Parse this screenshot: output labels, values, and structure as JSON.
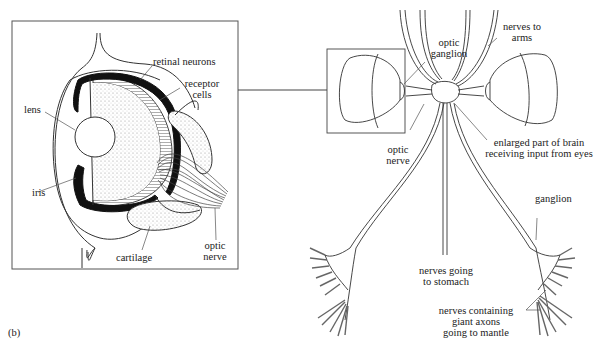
{
  "figure": {
    "panel_label": "(b)"
  },
  "eye_detail": {
    "labels": {
      "retinal_neurons": "retinal neurons",
      "receptor_cells_1": "receptor",
      "receptor_cells_2": "cells",
      "lens": "lens",
      "iris": "iris",
      "cartilage": "cartilage",
      "optic_nerve_1": "optic",
      "optic_nerve_2": "nerve"
    }
  },
  "nervous_system": {
    "labels": {
      "optic_ganglion_1": "optic",
      "optic_ganglion_2": "ganglion",
      "nerves_to_arms_1": "nerves to",
      "nerves_to_arms_2": "arms",
      "optic_nerve_1": "optic",
      "optic_nerve_2": "nerve",
      "enlarged_brain_1": "enlarged part of brain",
      "enlarged_brain_2": "receiving input from eyes",
      "ganglion": "ganglion",
      "nerves_stomach_1": "nerves going",
      "nerves_stomach_2": "to stomach",
      "giant_axons_1": "nerves containing",
      "giant_axons_2": "giant axons",
      "giant_axons_3": "going to mantle"
    }
  },
  "colors": {
    "line": "#333333",
    "fill_dark": "#111111",
    "stipple": "#e8e8e8"
  }
}
